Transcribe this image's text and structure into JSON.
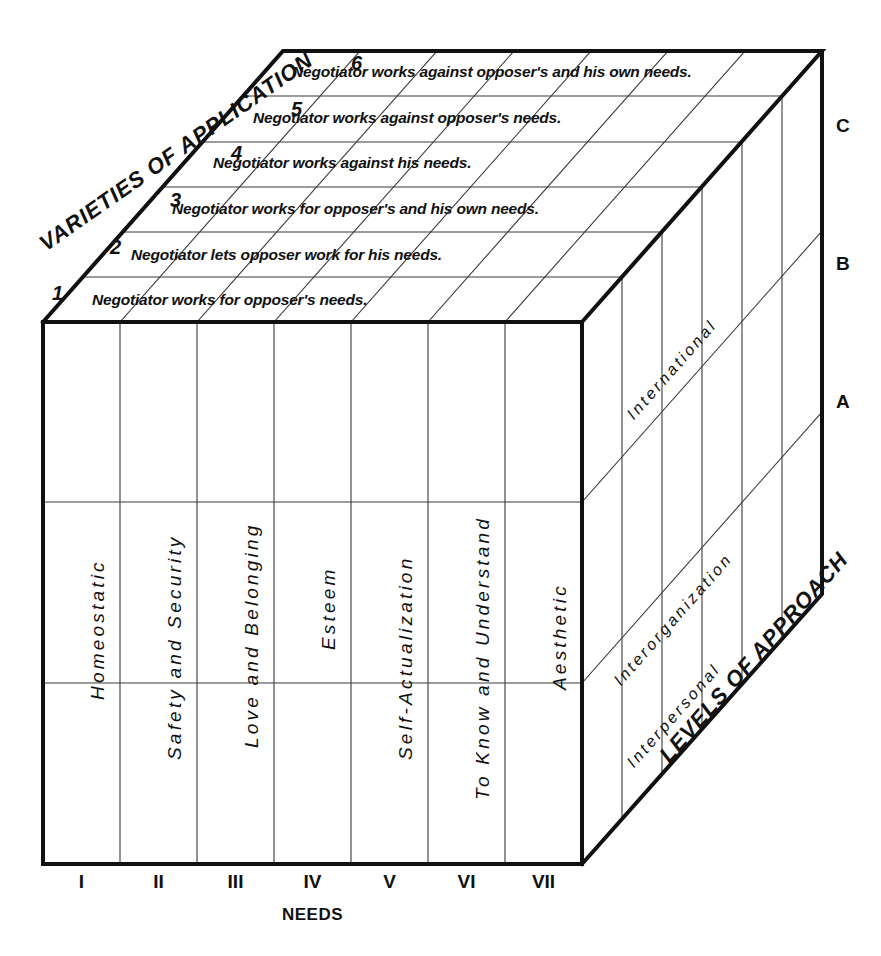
{
  "diagram": {
    "axes": {
      "front_axis_caption": "NEEDS",
      "top_axis_caption": "VARIETIES OF APPLICATION",
      "right_axis_caption": "LEVELS OF APPROACH"
    },
    "needs": {
      "tick_labels": [
        "I",
        "II",
        "III",
        "IV",
        "V",
        "VI",
        "VII"
      ],
      "names": [
        "Homeostatic",
        "Safety and Security",
        "Love and Belonging",
        "Esteem",
        "Self-Actualization",
        "To Know and Understand",
        "Aesthetic"
      ]
    },
    "varieties_of_application": {
      "numbers": [
        "1",
        "2",
        "3",
        "4",
        "5",
        "6"
      ],
      "statements": [
        "Negotiator works for opposer's needs.",
        "Negotiator lets opposer work for his needs.",
        "Negotiator works for opposer's and his own needs.",
        "Negotiator works against his needs.",
        "Negotiator works against opposer's needs.",
        "Negotiator works against opposer's and his own needs."
      ]
    },
    "levels_of_approach": {
      "tick_labels": [
        "A",
        "B",
        "C"
      ],
      "names": [
        "Interpersonal",
        "Interorganization",
        "International"
      ]
    },
    "colors": {
      "ink": "#111111",
      "paper": "#ffffff",
      "hairline": "#333333"
    }
  }
}
